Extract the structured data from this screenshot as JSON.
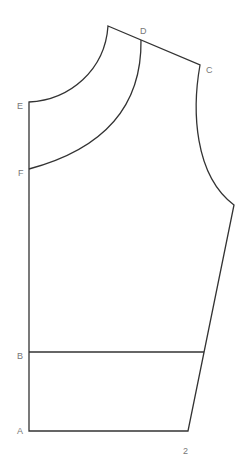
{
  "diagram": {
    "type": "sewing-pattern-bodice",
    "labels": {
      "A": "A",
      "B": "B",
      "C": "C",
      "D": "D",
      "E": "E",
      "F": "F",
      "page_number": "2"
    },
    "colors": {
      "line": "#333333",
      "label": "#777777",
      "background": "#ffffff"
    }
  }
}
